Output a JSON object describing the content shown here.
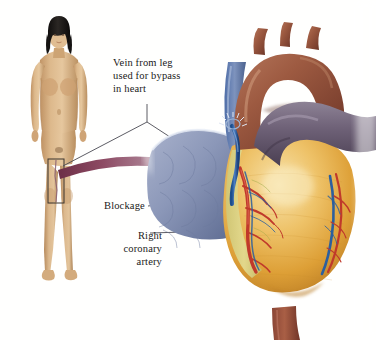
{
  "figure": {
    "background_color": "#ffffff",
    "width": 376,
    "height": 340
  },
  "labels": {
    "vein_graft": {
      "line1": "Vein from leg",
      "line2": "used for bypass",
      "line3": "in heart"
    },
    "blockage": "Blockage",
    "right_coronary_artery": {
      "line1": "Right",
      "line2": "coronary",
      "line3": "artery"
    }
  },
  "anatomy": {
    "body_figure": "female-anatomical-figure",
    "harvest_site": "saphenous-vein-harvest-rectangle",
    "transported_vein": "harvested-vein-arrow",
    "heart": "heart-organ",
    "aortic_arch": "aortic-arch",
    "pulmonary_artery": "pulmonary-artery",
    "superior_vena_cava": "superior-vena-cava",
    "inferior_vena_cava": "inferior-vena-cava",
    "lung": "left-lung",
    "ventricle": "left-ventricle",
    "graft_vessel": "vein-graft-on-heart",
    "coronary_arteries": "coronary-arteries"
  },
  "colors": {
    "skin": "#d8b183",
    "skin_shadow": "#b08b5c",
    "hair": "#1d1a18",
    "vein_purple": "#7a3a55",
    "vein_purple_light": "#b98fa3",
    "aorta_brown": "#9c5a40",
    "aorta_brown_dark": "#6d3626",
    "pulmonary_purple": "#6f6278",
    "lung_blue": "#8b97b8",
    "lung_blue_dark": "#5d6b91",
    "myocardium_gold": "#e2a63f",
    "myocardium_light": "#f3d58c",
    "fat_yellow": "#ddd27e",
    "artery_red": "#c0392b",
    "vein_blue": "#2c5f9e",
    "leader_line": "#4a4a52",
    "label_text": "#1a1a20"
  }
}
